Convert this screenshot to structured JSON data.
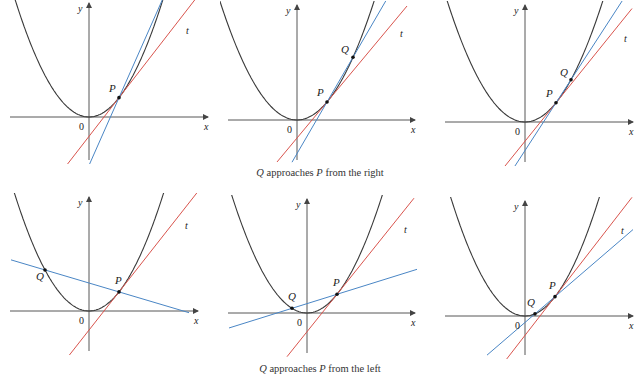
{
  "colors": {
    "curve": "#3a3a3a",
    "axis": "#444444",
    "tangent": "#d9544d",
    "secant": "#4a86c5",
    "text": "#222222"
  },
  "captions": {
    "right": {
      "q": "Q",
      "mid": " approaches ",
      "p": "P",
      "tail": " from the right"
    },
    "left": {
      "q": "Q",
      "mid": " approaches ",
      "p": "P",
      "tail": " from the left"
    }
  },
  "labels": {
    "x": "x",
    "y": "y",
    "origin": "0",
    "P": "P",
    "Q": "Q",
    "t": "t"
  },
  "panels": [
    {
      "id": "r1",
      "row": "right",
      "ox": 89,
      "oy": 117,
      "k": 0.0215,
      "xmin": -80,
      "xmax": 100,
      "ytop": 3,
      "ybot": 160,
      "xaxL": 10,
      "xaxR": 208,
      "P": 30,
      "Q": 75,
      "secY0": -50,
      "tanRange": [
        -45,
        108
      ],
      "secRange": [
        0,
        78
      ],
      "tLabel": [
        186,
        34
      ],
      "qLabelDx": -14,
      "qLabelDy": -6,
      "pLabelDx": -10,
      "pLabelDy": -6
    },
    {
      "id": "r2",
      "row": "right",
      "ox": 297,
      "oy": 120,
      "k": 0.02,
      "xmin": -78,
      "xmax": 80,
      "ytop": 5,
      "ybot": 160,
      "xaxL": 228,
      "xaxR": 415,
      "P": 30,
      "Q": 56,
      "tanRange": [
        -20,
        110
      ],
      "secRange": [
        -5,
        92
      ],
      "tLabel": [
        400,
        37
      ],
      "qLabelDx": -12,
      "qLabelDy": -4,
      "pLabelDx": -10,
      "pLabelDy": -6
    },
    {
      "id": "r3",
      "row": "right",
      "ox": 525,
      "oy": 122,
      "k": 0.02,
      "xmin": -78,
      "xmax": 80,
      "ytop": 5,
      "ybot": 162,
      "xaxL": 445,
      "xaxR": 633,
      "P": 31,
      "Q": 46,
      "tanRange": [
        -20,
        107
      ],
      "secRange": [
        -12,
        100
      ],
      "tLabel": [
        624,
        42
      ],
      "qLabelDx": -11,
      "qLabelDy": -4,
      "pLabelDx": -10,
      "pLabelDy": -6
    },
    {
      "id": "l1",
      "row": "left",
      "ox": 89,
      "oy": 311,
      "k": 0.0212,
      "xmin": -78,
      "xmax": 80,
      "ytop": 197,
      "ybot": 351,
      "xaxL": 10,
      "xaxR": 198,
      "P": 30,
      "Q": -44,
      "tanRange": [
        -20,
        108
      ],
      "secRange": [
        -78,
        100
      ],
      "tLabel": [
        185,
        229
      ],
      "qLabelDx": -9,
      "qLabelDy": 10,
      "pLabelDx": -4,
      "pLabelDy": -8
    },
    {
      "id": "l2",
      "row": "left",
      "ox": 307,
      "oy": 313,
      "k": 0.0208,
      "xmin": -78,
      "xmax": 80,
      "ytop": 199,
      "ybot": 353,
      "xaxL": 228,
      "xaxR": 415,
      "P": 30,
      "Q": -15,
      "tanRange": [
        -20,
        107
      ],
      "secRange": [
        -78,
        110
      ],
      "tLabel": [
        404,
        233
      ],
      "qLabelDx": -4,
      "qLabelDy": -8,
      "pLabelDx": -4,
      "pLabelDy": -8
    },
    {
      "id": "l3",
      "row": "left",
      "ox": 525,
      "oy": 316,
      "k": 0.0215,
      "xmin": -78,
      "xmax": 80,
      "ytop": 201,
      "ybot": 355,
      "xaxL": 445,
      "xaxR": 633,
      "P": 30,
      "Q": 10,
      "tanRange": [
        -22,
        107
      ],
      "secRange": [
        -38,
        108
      ],
      "tLabel": [
        621,
        234
      ],
      "qLabelDx": -8,
      "qLabelDy": -8,
      "pLabelDx": -6,
      "pLabelDy": -8
    }
  ],
  "chart_data": {
    "type": "diagram",
    "curve": "y = x^2 (parabola through origin)",
    "series": [
      {
        "name": "Q approaches P from the right",
        "panels": 3,
        "Q_relative_to_P": [
          "far right",
          "closer right",
          "very close right"
        ]
      },
      {
        "name": "Q approaches P from the left",
        "panels": 3,
        "Q_relative_to_P": [
          "far left",
          "closer left",
          "very close left"
        ]
      }
    ],
    "legend": {
      "tangent_line": "t (red)",
      "secant_line": "PQ (blue)",
      "curve": "parabola (black)"
    }
  }
}
